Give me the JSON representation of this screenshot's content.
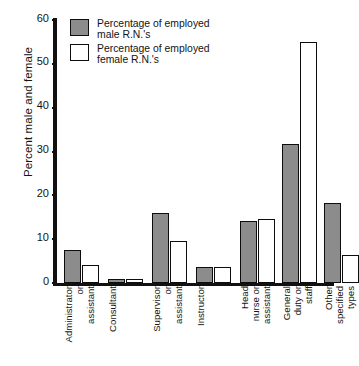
{
  "chart_data": {
    "type": "bar",
    "title": "",
    "subtitle": "",
    "xlabel": "",
    "ylabel": "Percent male and female",
    "ylim": [
      0,
      60
    ],
    "ytick_labels": [
      "60",
      "50",
      "40",
      "30",
      "20",
      "10",
      "0"
    ],
    "ytick_values": [
      60,
      50,
      40,
      30,
      20,
      10,
      0
    ],
    "grid": false,
    "legend_position": "top-left",
    "categories": [
      "Administrator or assistant",
      "Consultant",
      "Supervisor or assistant",
      "Instructor",
      "Head nurse or assistant",
      "General duty or staff",
      "Other specified types"
    ],
    "category_lines": [
      [
        "Administrator",
        "or",
        "assistant"
      ],
      [
        "Consultant"
      ],
      [
        "Supervisor",
        "or",
        "assistant"
      ],
      [
        "Instructor"
      ],
      [
        "Head",
        "nurse or",
        "assistant"
      ],
      [
        "General",
        "duty or",
        "staff"
      ],
      [
        "Other",
        "specified",
        "types"
      ]
    ],
    "series": [
      {
        "name": "Percentage of employed male R.N.'s",
        "color": "#8c8c8c",
        "values": [
          7.5,
          1.0,
          16.0,
          3.6,
          14.2,
          31.7,
          18.3
        ]
      },
      {
        "name": "Percentage of employed female R.N.'s",
        "color": "#ffffff",
        "values": [
          4.1,
          1.0,
          9.6,
          3.6,
          14.5,
          55.0,
          6.4
        ]
      }
    ]
  },
  "legend": {
    "items": [
      {
        "label": "Percentage of employed\nmale R.N.'s",
        "swatch": "male"
      },
      {
        "label": "Percentage of employed\nfemale R.N.'s",
        "swatch": "female"
      }
    ]
  }
}
